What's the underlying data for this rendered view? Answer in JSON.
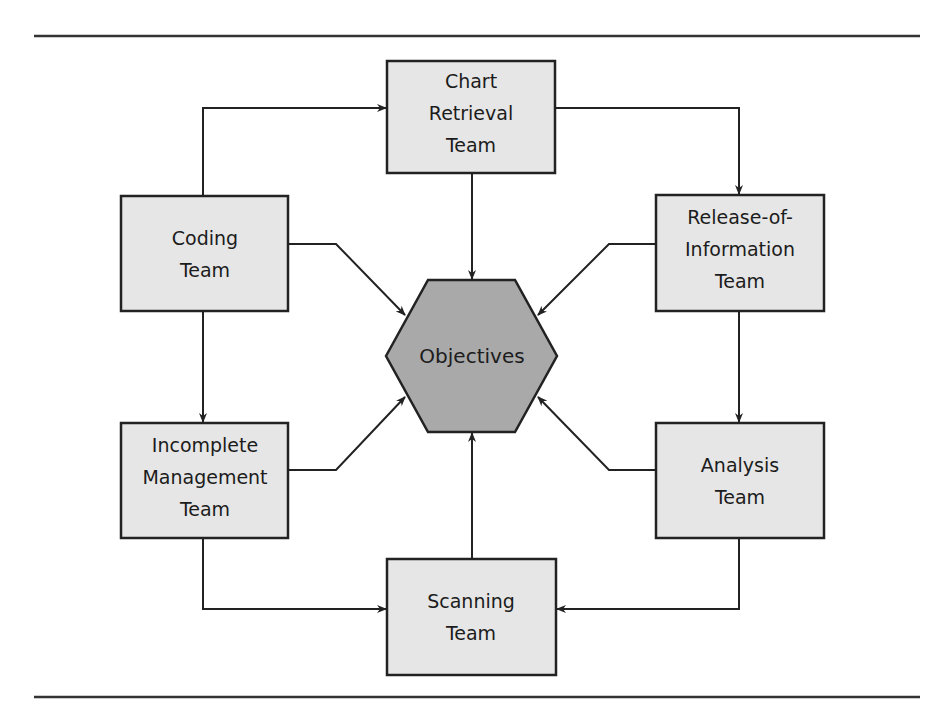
{
  "colors": {
    "box_fill": "#e6e6e6",
    "hex_fill": "#a9a9a9",
    "stroke": "#222222",
    "rule": "#333333",
    "background": "#ffffff"
  },
  "center": {
    "label": "Objectives"
  },
  "teams": [
    {
      "id": "chart-retrieval",
      "lines": [
        "Chart",
        "Retrieval",
        "Team"
      ]
    },
    {
      "id": "coding",
      "lines": [
        "Coding",
        "Team"
      ]
    },
    {
      "id": "release-of-information",
      "lines": [
        "Release-of-",
        "Information",
        "Team"
      ]
    },
    {
      "id": "incomplete-management",
      "lines": [
        "Incomplete",
        "Management",
        "Team"
      ]
    },
    {
      "id": "analysis",
      "lines": [
        "Analysis",
        "Team"
      ]
    },
    {
      "id": "scanning",
      "lines": [
        "Scanning",
        "Team"
      ]
    }
  ]
}
